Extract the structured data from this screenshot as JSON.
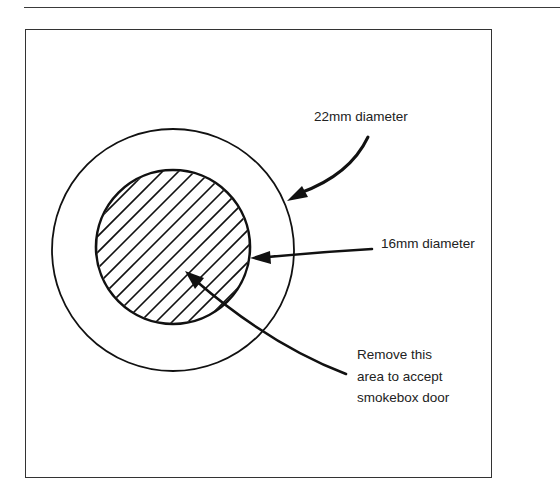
{
  "figure": {
    "outer_circle": {
      "label": "22mm diameter",
      "cx": 173,
      "cy": 250,
      "r": 121
    },
    "inner_circle": {
      "label": "16mm diameter",
      "cx": 173,
      "cy": 247,
      "r": 77,
      "hatched": true
    },
    "callout": {
      "lines": [
        "Remove this",
        "area to accept",
        "smokebox door"
      ]
    },
    "colors": {
      "ink": "#111111",
      "frame": "#333333",
      "background": "#ffffff"
    }
  }
}
